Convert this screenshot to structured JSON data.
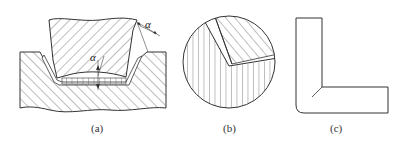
{
  "figure": {
    "panels": [
      {
        "id": "a",
        "caption": "(a)",
        "annotations": [
          "α",
          "α"
        ]
      },
      {
        "id": "b",
        "caption": "(b)"
      },
      {
        "id": "c",
        "caption": "(c)"
      }
    ]
  },
  "colors": {
    "line": "#333333",
    "background": "#ffffff"
  }
}
